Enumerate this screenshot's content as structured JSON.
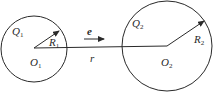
{
  "diagram": {
    "colors": {
      "stroke": "#2a2a2a",
      "background": "#ffffff"
    },
    "sphere1": {
      "charge_label": "Q",
      "charge_sub": "1",
      "center_label": "O",
      "center_sub": "1",
      "radius_label": "R",
      "radius_sub": "1"
    },
    "sphere2": {
      "charge_label": "Q",
      "charge_sub": "2",
      "center_label": "O",
      "center_sub": "2",
      "radius_label": "R",
      "radius_sub": "2"
    },
    "unit_vector_label": "e",
    "distance_label": "r",
    "relations": [
      "sphere2 is larger than sphere1",
      "distance r measured center-to-center from O1 to O2",
      "unit vector e points from sphere1 toward sphere2"
    ]
  }
}
